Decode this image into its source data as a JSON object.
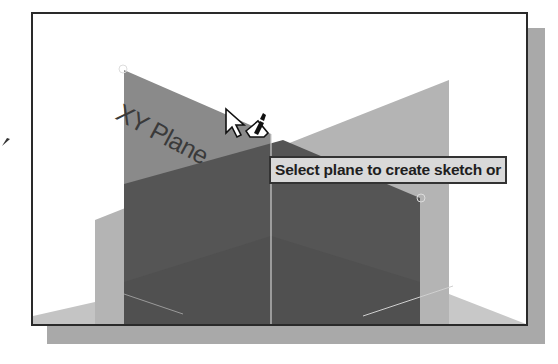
{
  "viewport": {
    "plane_label": "XY Plane",
    "tooltip": "Select plane to create sketch or"
  },
  "cursor": {
    "icon": "select-pointer-with-sketch-icon"
  },
  "colors": {
    "frame_border": "#2a2a2a",
    "frame_shadow": "#a9a9a9",
    "light_plane": "#b4b4b4",
    "xy_plane": "#8a8a8a",
    "dark_plane": "#555555",
    "floor_plane": "#c4c4c4",
    "tooltip_bg": "#d9d9d9"
  }
}
